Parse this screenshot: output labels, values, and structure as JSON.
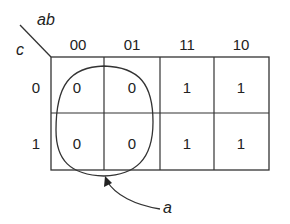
{
  "kmap": {
    "col_var": "ab",
    "row_var": "c",
    "col_headers": [
      "00",
      "01",
      "11",
      "10"
    ],
    "row_headers": [
      "0",
      "1"
    ],
    "cells": [
      [
        "0",
        "0",
        "1",
        "1"
      ],
      [
        "0",
        "0",
        "1",
        "1"
      ]
    ],
    "group_label": "a",
    "group_description": "loop enclosing columns 00 and 01 in both rows"
  },
  "colors": {
    "line": "#333333",
    "text": "#222222",
    "background": "#ffffff"
  }
}
